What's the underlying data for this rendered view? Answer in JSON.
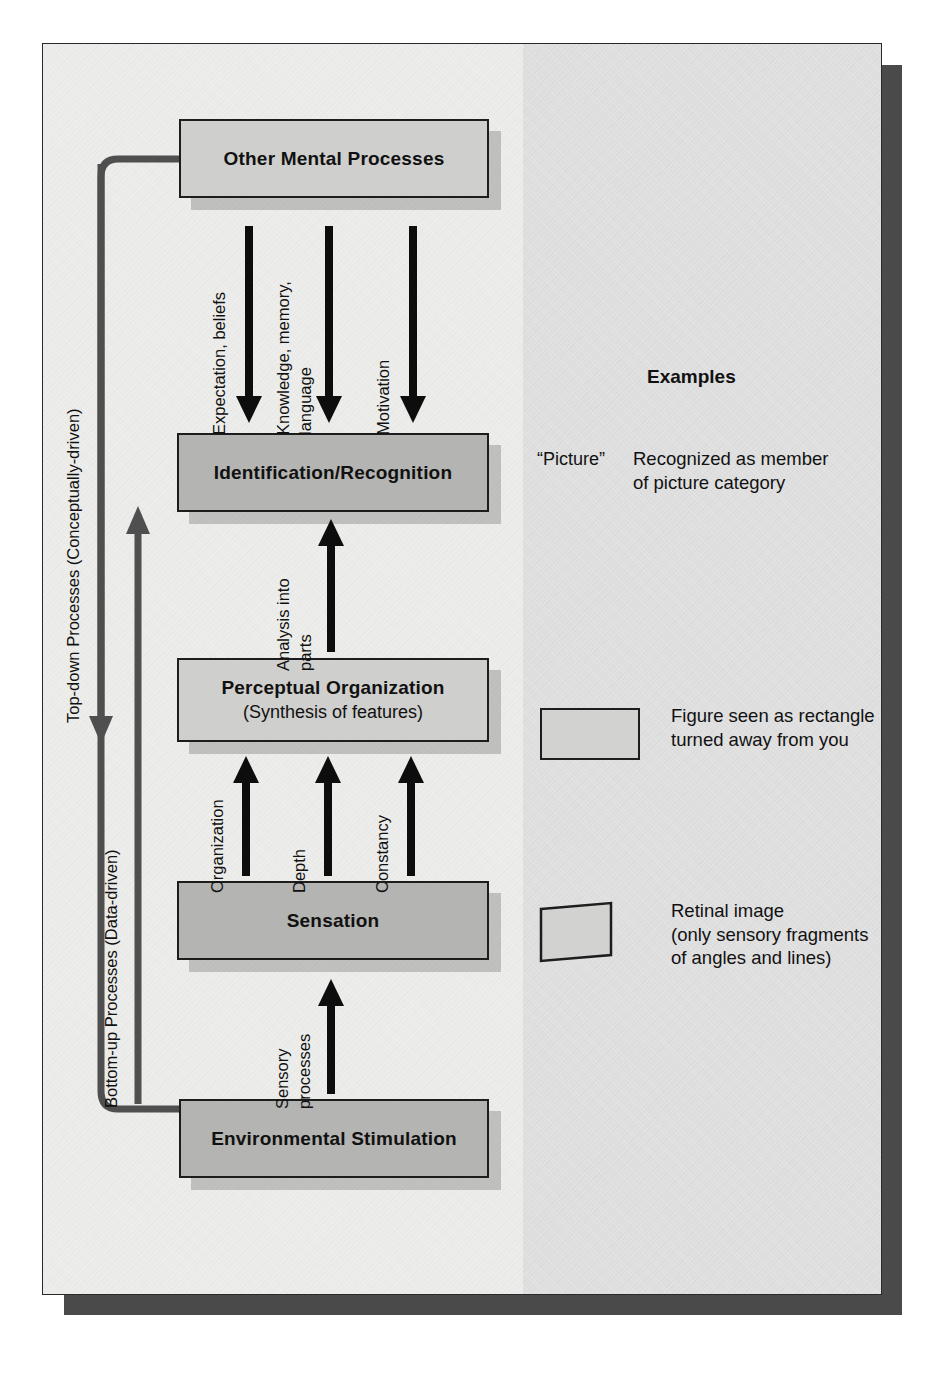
{
  "figure": {
    "colors": {
      "page_background": "#e8e8e6",
      "band_left": "#ebebe9",
      "band_right": "#dedede",
      "box_light": "#cfcfcd",
      "box_dark": "#b4b4b2",
      "outline": "#1d1d1d",
      "arrow": "#0d0d0d",
      "loop_line": "#4f4f4f",
      "page_drop_shadow": "#4a4a4a"
    }
  },
  "boxes": [
    {
      "id": "other-mental-processes",
      "label": "Other Mental Processes",
      "sublabel": "",
      "shade": "light"
    },
    {
      "id": "identification-recognition",
      "label": "Identification/Recognition",
      "sublabel": "",
      "shade": "dark"
    },
    {
      "id": "perceptual-organization",
      "label": "Perceptual Organization",
      "sublabel": "(Synthesis of features)",
      "shade": "light"
    },
    {
      "id": "sensation",
      "label": "Sensation",
      "sublabel": "",
      "shade": "dark"
    },
    {
      "id": "environmental-stimulation",
      "label": "Environmental Stimulation",
      "sublabel": "",
      "shade": "dark"
    }
  ],
  "arrow_labels": {
    "top_down": [
      {
        "id": "expectation-beliefs",
        "line1": "Expectation, beliefs",
        "line2": ""
      },
      {
        "id": "knowledge-memory-language",
        "line1": "Knowledge, memory,",
        "line2": "language"
      },
      {
        "id": "motivation",
        "line1": "Motivation",
        "line2": ""
      }
    ],
    "analysis": {
      "id": "analysis-into-parts",
      "line1": "Analysis into",
      "line2": "parts"
    },
    "bottom_up": [
      {
        "id": "organization",
        "line1": "Organization",
        "line2": ""
      },
      {
        "id": "depth",
        "line1": "Depth",
        "line2": ""
      },
      {
        "id": "constancy",
        "line1": "Constancy",
        "line2": ""
      }
    ],
    "sensory": {
      "id": "sensory-processes",
      "line1": "Sensory",
      "line2": "processes"
    }
  },
  "side_labels": [
    {
      "id": "top-down-processes",
      "text": "Top-down Processes (Conceptually-driven)"
    },
    {
      "id": "bottom-up-processes",
      "text": "Bottom-up Processes (Data-driven)"
    }
  ],
  "examples": {
    "heading": "Examples",
    "items": [
      {
        "id": "picture-example",
        "cue_type": "text",
        "cue_text": "“Picture”",
        "description_line1": "Recognized as member",
        "description_line2": "of picture category",
        "description_line3": ""
      },
      {
        "id": "rectangle-example",
        "cue_type": "rectangle",
        "cue_text": "",
        "description_line1": "Figure seen as rectangle",
        "description_line2": "turned away from you",
        "description_line3": ""
      },
      {
        "id": "retinal-image-example",
        "cue_type": "trapezoid",
        "cue_text": "",
        "description_line1": "Retinal image",
        "description_line2": "(only sensory fragments",
        "description_line3": "of angles and lines)"
      }
    ]
  }
}
